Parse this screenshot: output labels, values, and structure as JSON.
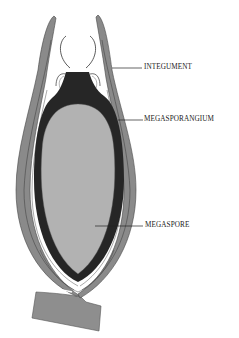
{
  "diagram": {
    "colors": {
      "integument": "#8a8a8a",
      "integument_inner": "#a6a6a6",
      "megasporangium": "#262626",
      "megaspore": "#b2b2b2",
      "outline": "#3a3a3a",
      "background": "#ffffff"
    },
    "labels": [
      {
        "id": "integument",
        "text": "INTEGUMENT"
      },
      {
        "id": "megasporangium",
        "text": "MEGASPORANGIUM"
      },
      {
        "id": "megaspore",
        "text": "MEGASPORE"
      }
    ]
  }
}
